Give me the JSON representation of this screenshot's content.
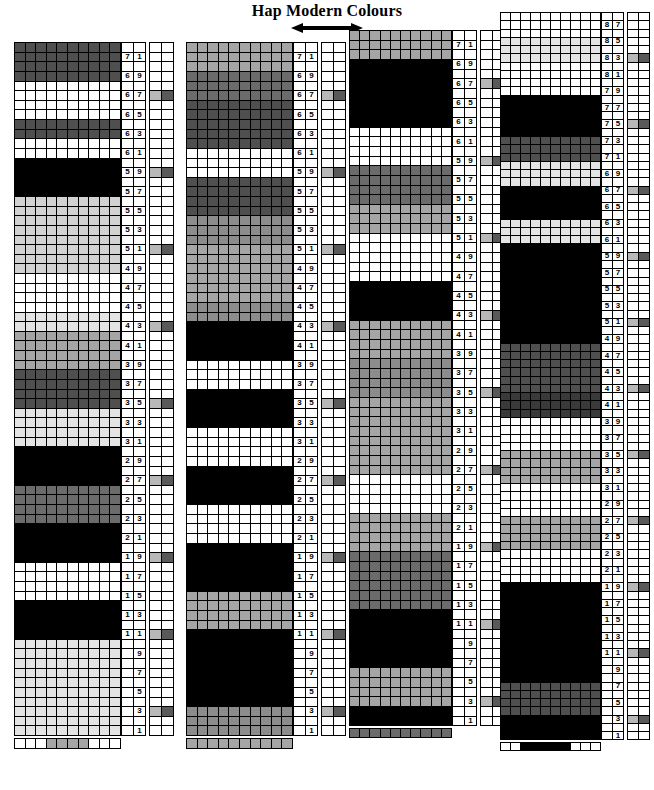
{
  "header": {
    "title": "Hap Modern Colours",
    "arrow_icon": "double-headed-horizontal-arrow"
  },
  "palette": {
    "white": "#ffffff",
    "near_white": "#f2f2f2",
    "pale": "#e4e4e4",
    "light": "#d2d2d2",
    "light_mid": "#bdbdbd",
    "mid": "#a5a5a5",
    "mid_dark": "#8c8c8c",
    "dark": "#6b6b6b",
    "darker": "#4f4f4f",
    "very_dark": "#3a3a3a",
    "black": "#000000",
    "key_light": "#b8b8b8",
    "key_dark": "#595959"
  },
  "chart_data": {
    "type": "heatmap",
    "title": "Hap Modern Colours",
    "columns_per_chart": 10,
    "row_number_parity": "odd",
    "legend_marker_interval": 8,
    "charts": [
      {
        "id": "chart-1",
        "name": "Chart 1",
        "top_row_number": 71,
        "bottom_row_number": 1,
        "row_count": 72,
        "row_numbers": [
          71,
          69,
          67,
          65,
          63,
          61,
          59,
          57,
          55,
          53,
          51,
          49,
          47,
          45,
          43,
          41,
          39,
          37,
          35,
          33,
          31,
          29,
          27,
          25,
          23,
          21,
          19,
          17,
          15,
          13,
          11,
          9,
          7,
          5,
          3,
          1
        ],
        "rows_top_to_bottom": [
          "darker",
          "darker",
          "darker",
          "darker",
          "white",
          "white",
          "white",
          "white",
          "darker",
          "darker",
          "white",
          "white",
          "black",
          "black",
          "black",
          "black",
          "light",
          "light",
          "light",
          "light",
          "light",
          "light",
          "light",
          "light",
          "white",
          "white",
          "white",
          "white",
          "pale",
          "pale",
          "mid",
          "mid",
          "mid",
          "mid",
          "darker",
          "darker",
          "darker",
          "darker",
          "pale",
          "pale",
          "pale",
          "pale",
          "black",
          "black",
          "black",
          "black",
          "dark",
          "dark",
          "dark",
          "dark",
          "black",
          "black",
          "black",
          "black",
          "white",
          "white",
          "white",
          "white",
          "black",
          "black",
          "black",
          "black",
          "pale",
          "pale",
          "pale",
          "pale",
          "pale",
          "pale",
          "pale",
          "pale",
          "pale",
          "pale",
          "pale",
          "pale",
          "mid",
          "mid",
          "mid",
          "mid",
          "mid",
          "mid",
          "mid",
          "mid",
          "mid_dark",
          "mid_dark",
          "mid_dark",
          "mid_dark",
          "black",
          "black",
          "black",
          "black",
          "dark",
          "dark",
          "dark",
          "dark",
          "white",
          "white",
          "white",
          "white",
          "pale",
          "pale",
          "pale",
          "pale",
          "pale",
          "pale",
          "pale",
          "pale",
          "dark",
          "dark",
          "dark",
          "dark",
          "dark",
          "dark",
          "black",
          "black",
          "black",
          "black",
          "black",
          "black",
          "black",
          "black"
        ],
        "footer_strip": [
          "white",
          "white",
          "white",
          "mid",
          "mid",
          "mid",
          "mid",
          "white",
          "white",
          "white"
        ]
      },
      {
        "id": "chart-2",
        "name": "Chart 2",
        "top_row_number": 71,
        "bottom_row_number": 1,
        "row_count": 72,
        "row_numbers": [
          71,
          69,
          67,
          65,
          63,
          61,
          59,
          57,
          55,
          53,
          51,
          49,
          47,
          45,
          43,
          41,
          39,
          37,
          35,
          33,
          31,
          29,
          27,
          25,
          23,
          21,
          19,
          17,
          15,
          13,
          11,
          9,
          7,
          5,
          3,
          1
        ],
        "rows_top_to_bottom": [
          "mid",
          "mid",
          "mid",
          "dark",
          "dark",
          "dark",
          "darker",
          "darker",
          "darker",
          "darker",
          "darker",
          "white",
          "white",
          "white",
          "darker",
          "darker",
          "darker",
          "darker",
          "mid_dark",
          "mid_dark",
          "mid_dark",
          "mid",
          "mid",
          "mid",
          "mid",
          "mid",
          "mid",
          "mid_dark",
          "mid_dark",
          "black",
          "black",
          "black",
          "black",
          "white",
          "white",
          "white",
          "black",
          "black",
          "black",
          "black",
          "white",
          "white",
          "white",
          "white",
          "black",
          "black",
          "black",
          "black",
          "white",
          "white",
          "white",
          "white",
          "black",
          "black",
          "black",
          "black",
          "black",
          "mid",
          "mid",
          "mid",
          "mid",
          "black",
          "black",
          "black",
          "black",
          "black",
          "black",
          "black",
          "black",
          "mid_dark",
          "mid_dark",
          "mid_dark",
          "mid_dark",
          "darker",
          "darker",
          "darker",
          "darker",
          "mid",
          "mid",
          "mid",
          "mid",
          "white",
          "white",
          "white",
          "white",
          "mid",
          "mid",
          "mid",
          "mid",
          "mid",
          "mid",
          "mid",
          "mid",
          "mid_dark",
          "mid_dark",
          "mid_dark",
          "mid_dark",
          "mid_dark",
          "mid_dark",
          "mid",
          "mid",
          "mid",
          "mid",
          "black",
          "black",
          "black",
          "black",
          "white",
          "white",
          "white",
          "white",
          "dark",
          "dark",
          "dark",
          "dark",
          "dark",
          "dark",
          "white",
          "white",
          "white",
          "white",
          "black",
          "black",
          "black",
          "black",
          "black",
          "black",
          "black"
        ],
        "footer_strip": [
          "mid",
          "mid",
          "mid",
          "mid",
          "mid",
          "mid",
          "mid",
          "mid",
          "mid",
          "mid"
        ]
      },
      {
        "id": "chart-3",
        "name": "Chart 3",
        "top_row_number": 71,
        "bottom_row_number": 1,
        "row_count": 72,
        "row_numbers": [
          71,
          69,
          67,
          65,
          63,
          61,
          59,
          57,
          55,
          53,
          51,
          49,
          47,
          45,
          43,
          41,
          39,
          37,
          35,
          33,
          31,
          29,
          27,
          25,
          23,
          21,
          19,
          17,
          15,
          13,
          11,
          9,
          7,
          5,
          3,
          1
        ],
        "rows_top_to_bottom": [
          "mid",
          "mid",
          "mid",
          "black",
          "black",
          "black",
          "black",
          "black",
          "black",
          "black",
          "white",
          "white",
          "white",
          "white",
          "dark",
          "dark",
          "dark",
          "dark",
          "mid",
          "mid",
          "mid",
          "white",
          "white",
          "white",
          "white",
          "white",
          "black",
          "black",
          "black",
          "black",
          "mid",
          "mid",
          "mid",
          "mid",
          "mid_dark",
          "mid_dark",
          "mid_dark",
          "mid_dark",
          "mid",
          "mid",
          "mid",
          "mid",
          "mid",
          "mid",
          "mid",
          "mid",
          "white",
          "white",
          "white",
          "white",
          "mid",
          "mid",
          "mid",
          "mid",
          "dark",
          "dark",
          "dark",
          "dark",
          "dark",
          "dark",
          "black",
          "black",
          "black",
          "black",
          "black",
          "black",
          "mid",
          "mid",
          "mid",
          "mid",
          "black",
          "black",
          "black",
          "black",
          "white",
          "white",
          "white",
          "white",
          "black",
          "black",
          "black",
          "black",
          "white",
          "white",
          "white",
          "white",
          "black",
          "black",
          "black",
          "black",
          "white",
          "white",
          "white",
          "white",
          "black",
          "black",
          "black",
          "black",
          "black",
          "black",
          "mid",
          "mid",
          "mid",
          "mid",
          "mid",
          "mid",
          "mid",
          "mid",
          "mid",
          "mid",
          "mid",
          "mid",
          "dark",
          "dark",
          "dark",
          "dark",
          "darker",
          "darker",
          "darker",
          "darker",
          "white",
          "white",
          "white",
          "white",
          "darker",
          "darker",
          "darker",
          "darker",
          "darker",
          "darker",
          "darker",
          "darker"
        ],
        "footer_strip": [
          "dark",
          "dark",
          "dark",
          "dark",
          "dark",
          "dark",
          "dark",
          "dark",
          "dark",
          "dark"
        ]
      },
      {
        "id": "chart-4",
        "name": "Chart 4",
        "top_row_number": 87,
        "bottom_row_number": 1,
        "row_count": 88,
        "row_numbers": [
          87,
          85,
          83,
          81,
          79,
          77,
          75,
          73,
          71,
          69,
          67,
          65,
          63,
          61,
          59,
          57,
          55,
          53,
          51,
          49,
          47,
          45,
          43,
          41,
          39,
          37,
          35,
          33,
          31,
          29,
          27,
          25,
          23,
          21,
          19,
          17,
          15,
          13,
          11,
          9,
          7,
          5,
          3,
          1
        ],
        "rows_top_to_bottom": [
          "white",
          "white",
          "white",
          "pale",
          "pale",
          "pale",
          "white",
          "white",
          "white",
          "white",
          "black",
          "black",
          "black",
          "black",
          "black",
          "darker",
          "darker",
          "darker",
          "pale",
          "pale",
          "pale",
          "black",
          "black",
          "black",
          "black",
          "pale",
          "pale",
          "pale",
          "black",
          "black",
          "black",
          "black",
          "black",
          "black",
          "black",
          "black",
          "black",
          "black",
          "black",
          "black",
          "darker",
          "darker",
          "darker",
          "darker",
          "darker",
          "darker",
          "very_dark",
          "very_dark",
          "very_dark",
          "white",
          "white",
          "white",
          "white",
          "mid",
          "mid",
          "mid",
          "mid",
          "white",
          "white",
          "white",
          "white",
          "mid",
          "mid",
          "mid",
          "mid",
          "white",
          "white",
          "white",
          "white",
          "black",
          "black",
          "black",
          "black",
          "black",
          "black",
          "black",
          "black",
          "black",
          "black",
          "black",
          "black",
          "darker",
          "darker",
          "darker",
          "darker",
          "black",
          "black",
          "black",
          "black",
          "darker",
          "darker",
          "darker",
          "darker",
          "darker",
          "darker",
          "mid_dark",
          "mid_dark",
          "mid_dark",
          "mid_dark",
          "pale",
          "pale",
          "pale",
          "pale",
          "white",
          "white",
          "white",
          "white",
          "white",
          "white",
          "white",
          "white",
          "pale",
          "pale",
          "pale",
          "pale",
          "black",
          "black",
          "black",
          "black",
          "black",
          "black",
          "black",
          "black",
          "black",
          "black",
          "darker",
          "darker",
          "darker",
          "darker",
          "dark",
          "dark",
          "dark",
          "dark",
          "dark",
          "dark",
          "dark",
          "dark",
          "white",
          "white",
          "white",
          "white",
          "white",
          "white",
          "white",
          "white"
        ],
        "footer_strip": [
          "white",
          "white",
          "black",
          "black",
          "black",
          "black",
          "black",
          "white",
          "white",
          "white"
        ]
      }
    ]
  }
}
